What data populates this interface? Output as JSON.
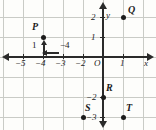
{
  "figure": {
    "type": "coordinate-plane",
    "background_color": "#fdfdfb",
    "grid_color": "#c9cbc6",
    "axis_color": "#2a2a2a",
    "point_color": "#1b1b1b",
    "origin_px": {
      "x": 103,
      "y": 57
    },
    "unit_px": 20,
    "grid": {
      "visible": true,
      "spacing_px": 20
    }
  },
  "axes": {
    "x_name": "x",
    "y_name": "y",
    "origin_label": "O",
    "x_tick_labels": [
      "−5",
      "−4",
      "−3",
      "−2",
      "1"
    ],
    "y_tick_labels": [
      "2",
      "1",
      "−2",
      "−3"
    ]
  },
  "ticks": {
    "x": [
      {
        "label": "−5",
        "value": -5,
        "px": 23
      },
      {
        "label": "−4",
        "value": -4,
        "px": 43
      },
      {
        "label": "−3",
        "value": -3,
        "px": 63
      },
      {
        "label": "−2",
        "value": -2,
        "px": 83
      },
      {
        "label": "1",
        "value": 1,
        "px": 123
      }
    ],
    "y": [
      {
        "label": "2",
        "value": 2,
        "px": 17
      },
      {
        "label": "1",
        "value": 1,
        "px": 37
      },
      {
        "label": "−2",
        "value": -2,
        "px": 97
      },
      {
        "label": "−3",
        "value": -3,
        "px": 117
      }
    ]
  },
  "points": [
    {
      "label": "P",
      "x": -4,
      "y": 1,
      "px": 43,
      "py": 37,
      "label_dx": -11,
      "label_dy": -16
    },
    {
      "label": "Q",
      "x": 1,
      "y": 2,
      "px": 123,
      "py": 17,
      "label_dx": 5,
      "label_dy": -14
    },
    {
      "label": "R",
      "x": 0,
      "y": -2,
      "px": 103,
      "py": 97,
      "label_dx": 4,
      "label_dy": -16
    },
    {
      "label": "S",
      "x": -2,
      "y": -3,
      "px": 83,
      "py": 117,
      "label_dx": 3,
      "label_dy": -15
    },
    {
      "label": "T",
      "x": 1,
      "y": -3,
      "px": 123,
      "py": 117,
      "label_dx": 4,
      "label_dy": -15
    }
  ],
  "annotations": [
    {
      "id": "vertical-move",
      "label": "1",
      "direction": "up",
      "label_px": 33,
      "label_py": 40,
      "line_px": 43,
      "line_py": 46
    },
    {
      "id": "horizontal-move",
      "label": "−4",
      "direction": "left",
      "label_px": 62,
      "label_py": 40,
      "line_px": 46,
      "line_py": 53
    }
  ]
}
